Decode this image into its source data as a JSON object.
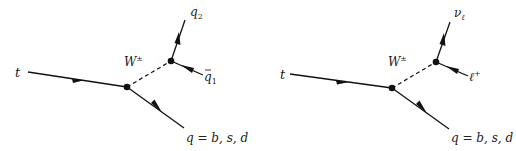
{
  "diagrams": [
    {
      "name": "hadronic-top-decay",
      "incoming": "t",
      "boson": "W",
      "boson_charge": "±",
      "outgoing_quark": "q = b, s, d",
      "w_decay_products": [
        {
          "symbol": "q",
          "subscript": "2",
          "bar": false
        },
        {
          "symbol": "q",
          "subscript": "1",
          "bar": true
        }
      ]
    },
    {
      "name": "leptonic-top-decay",
      "incoming": "t",
      "boson": "W",
      "boson_charge": "±",
      "outgoing_quark": "q = b, s, d",
      "w_decay_products": [
        {
          "symbol": "ν",
          "subscript": "ℓ",
          "bar": false
        },
        {
          "symbol": "ℓ",
          "superscript": "+",
          "bar": false
        }
      ]
    }
  ],
  "colors": {
    "line": "#111111",
    "text": "#222222",
    "background": "#ffffff"
  }
}
